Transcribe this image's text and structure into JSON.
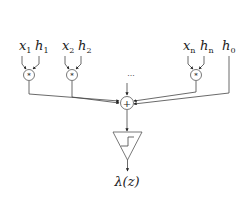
{
  "diagram": {
    "type": "neuron / perceptron schematic",
    "inputs": [
      {
        "x_label": "x",
        "x_sub": "1",
        "h_label": "h",
        "h_sub": "1",
        "cx": 29
      },
      {
        "x_label": "x",
        "x_sub": "2",
        "h_label": "h",
        "h_sub": "2",
        "cx": 72
      },
      {
        "x_label": "x",
        "x_sub": "n",
        "h_label": "h",
        "h_sub": "n",
        "cx": 196
      }
    ],
    "bias": {
      "label": "h",
      "sub": "0"
    },
    "ellipsis": "...",
    "multiply_symbol": "*",
    "sum_symbol": "+",
    "activation": "step",
    "output": {
      "label": "λ(z)"
    },
    "colors": {
      "line": "#444444",
      "text": "#222222",
      "background": "#ffffff"
    }
  }
}
